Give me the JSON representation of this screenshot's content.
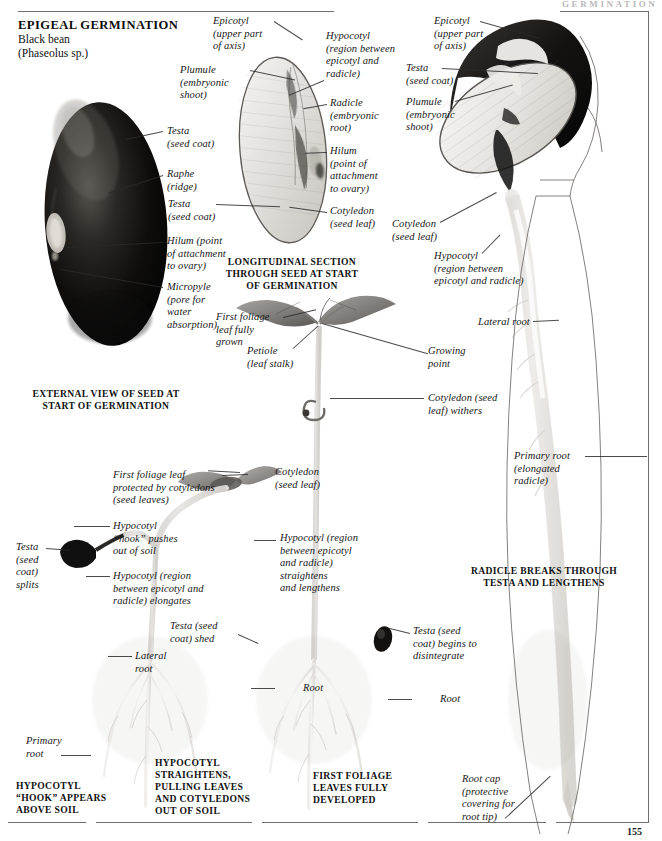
{
  "page": {
    "running_head": "GERMINATION",
    "folio": "155",
    "accent_dark": "#161616",
    "rule_color": "#6e6e6e"
  },
  "title": {
    "heading": "EPIGEAL GERMINATION",
    "common_name": "Black bean",
    "species": "(Phaseolus sp.)"
  },
  "captions": {
    "external_view": "EXTERNAL VIEW OF SEED AT\nSTART OF GERMINATION",
    "longitudinal_section": "LONGITUDINAL SECTION\nTHROUGH SEED AT START\nOF GERMINATION",
    "radicle_breaks": "RADICLE BREAKS THROUGH\nTESTA AND LENGTHENS",
    "hook_appears": "HYPOCOTYL\n“HOOK” APPEARS\nABOVE SOIL",
    "straightens": "HYPOCOTYL\nSTRAIGHTENS,\nPULLING LEAVES\nAND COTYLEDONS\nOUT OF SOIL",
    "first_foliage": "FIRST FOLIAGE\nLEAVES FULLY\nDEVELOPED"
  },
  "labels": {
    "seed_external": [
      {
        "id": "testa-external",
        "text": "Testa\n(seed coat)"
      },
      {
        "id": "raphe",
        "text": "Raphe\n(ridge)"
      },
      {
        "id": "hilum-external",
        "text": "Hilum (point\nof attachment\nto ovary)"
      },
      {
        "id": "micropyle",
        "text": "Micropyle\n(pore for\nwater\nabsorption)"
      }
    ],
    "seed_section": [
      {
        "id": "epicotyl-section",
        "text": "Epicotyl\n(upper part\nof axis)"
      },
      {
        "id": "plumule-section",
        "text": "Plumule\n(embryonic\nshoot)"
      },
      {
        "id": "hypocotyl-section",
        "text": "Hypocotyl\n(region between\nepicotyl and\nradicle)"
      },
      {
        "id": "radicle-section",
        "text": "Radicle\n(embryonic\nroot)"
      },
      {
        "id": "hilum-section",
        "text": "Hilum\n(point of\nattachment\nto ovary)"
      },
      {
        "id": "testa-section",
        "text": "Testa\n(seed coat)"
      },
      {
        "id": "cotyledon-section",
        "text": "Cotyledon\n(seed leaf)"
      }
    ],
    "germinating_seed": [
      {
        "id": "epicotyl-germ",
        "text": "Epicotyl\n(upper part\nof axis)"
      },
      {
        "id": "testa-germ",
        "text": "Testa\n(seed coat)"
      },
      {
        "id": "plumule-germ",
        "text": "Plumule\n(embryonic\nshoot)"
      },
      {
        "id": "cotyledon-germ",
        "text": "Cotyledon\n(seed leaf)"
      },
      {
        "id": "hypocotyl-germ",
        "text": "Hypocotyl\n(region between\nepicotyl and radicle)"
      },
      {
        "id": "lateral-root-germ",
        "text": "Lateral root"
      },
      {
        "id": "primary-root-germ",
        "text": "Primary root\n(elongated\nradicle)"
      },
      {
        "id": "root-cap",
        "text": "Root cap\n(protective\ncovering for\nroot tip)"
      }
    ],
    "seedling_mature": [
      {
        "id": "first-foliage-grown",
        "text": "First foliage\nleaf fully\ngrown"
      },
      {
        "id": "petiole",
        "text": "Petiole\n(leaf stalk)"
      },
      {
        "id": "growing-point",
        "text": "Growing\npoint"
      },
      {
        "id": "cotyledon-withers",
        "text": "Cotyledon (seed\nleaf) withers"
      }
    ],
    "stage_hook": [
      {
        "id": "first-foliage-protected",
        "text": "First foliage leaf\nprotected by cotyledons\n(seed leaves)"
      },
      {
        "id": "hypocotyl-hook",
        "text": "Hypocotyl\n“hook” pushes\nout of soil"
      },
      {
        "id": "testa-splits",
        "text": "Testa\n(seed\ncoat)\nsplits"
      },
      {
        "id": "hypocotyl-elongates",
        "text": "Hypocotyl (region\nbetween epicotyl and\nradicle) elongates"
      },
      {
        "id": "lateral-root-hook",
        "text": "Lateral\nroot"
      },
      {
        "id": "primary-root-hook",
        "text": "Primary\nroot"
      }
    ],
    "stage_straight": [
      {
        "id": "cotyledon-straight",
        "text": "Cotyledon\n(seed leaf)"
      },
      {
        "id": "hypocotyl-straightens",
        "text": "Hypocotyl (region\nbetween epicotyl\nand radicle)\nstraightens\nand lengthens"
      },
      {
        "id": "testa-shed",
        "text": "Testa (seed\ncoat) shed"
      },
      {
        "id": "root-straight",
        "text": "Root"
      }
    ],
    "stage_foliage": [
      {
        "id": "testa-disintegrates",
        "text": "Testa (seed\ncoat) begins to\ndisintegrate"
      },
      {
        "id": "root-foliage",
        "text": "Root"
      }
    ]
  }
}
